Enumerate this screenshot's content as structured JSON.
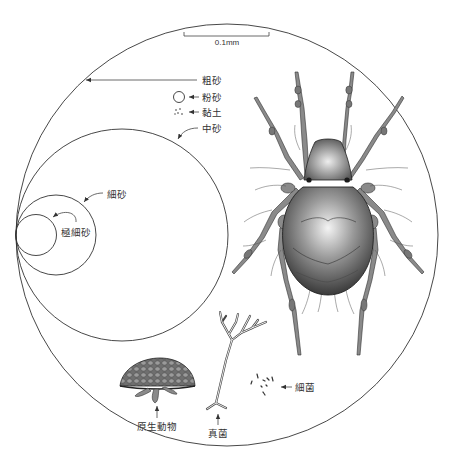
{
  "figure": {
    "scale_bar": {
      "label": "0.1mm"
    },
    "particles": [
      {
        "id": "coarse-sand",
        "label": "粗砂"
      },
      {
        "id": "silt",
        "label": "粉砂"
      },
      {
        "id": "clay",
        "label": "黏土"
      },
      {
        "id": "medium-sand",
        "label": "中砂"
      },
      {
        "id": "fine-sand",
        "label": "細砂"
      },
      {
        "id": "very-fine-sand",
        "label": "極細砂"
      }
    ],
    "organisms": [
      {
        "id": "protozoa",
        "label": "原生動物"
      },
      {
        "id": "fungi",
        "label": "真菌"
      },
      {
        "id": "bacteria",
        "label": "細菌"
      },
      {
        "id": "mite",
        "label": ""
      }
    ],
    "colors": {
      "line": "#333333",
      "background": "#ffffff",
      "mite_body": "#6b6b6b"
    }
  }
}
